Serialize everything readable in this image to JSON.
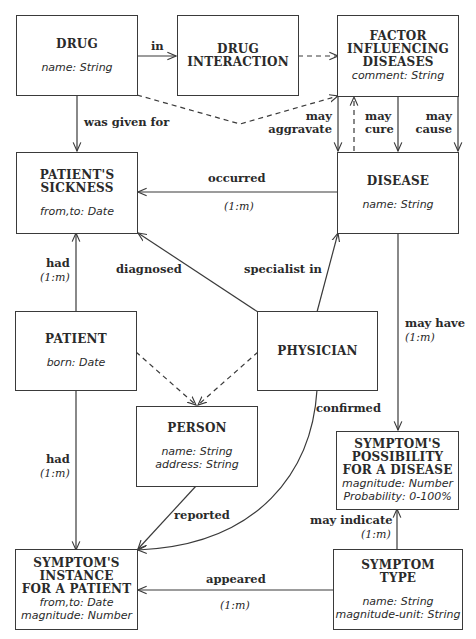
{
  "entities": {
    "drug": {
      "title": "DRUG",
      "attrs": "name: String"
    },
    "drug_interaction": {
      "title": "DRUG\nINTERACTION",
      "attrs": ""
    },
    "factor": {
      "title": "FACTOR\nINFLUENCING\nDISEASES",
      "attrs": "comment: String"
    },
    "patients_sickness": {
      "title": "PATIENT'S\nSICKNESS",
      "attrs": "from,to: Date"
    },
    "disease": {
      "title": "DISEASE",
      "attrs": "name: String"
    },
    "patient": {
      "title": "PATIENT",
      "attrs": "born: Date"
    },
    "physician": {
      "title": "PHYSICIAN",
      "attrs": ""
    },
    "person": {
      "title": "PERSON",
      "attrs": "name: String\naddress: String"
    },
    "symptom_possibility": {
      "title": "SYMPTOM'S\nPOSSIBILITY\nFOR A DISEASE",
      "attrs": "magnitude: Number\nProbability: 0-100%"
    },
    "symptom_instance": {
      "title": "SYMPTOM'S\nINSTANCE\nFOR A PATIENT",
      "attrs": "from,to: Date\nmagnitude: Number"
    },
    "symptom_type": {
      "title": "SYMPTOM\nTYPE",
      "attrs": "name: String\nmagnitude-unit: String"
    }
  },
  "relations": {
    "in": "in",
    "was_given_for": "was given for",
    "may_aggravate": "may\naggravate",
    "may_cure": "may\ncure",
    "may_cause": "may\ncause",
    "occurred": "occurred",
    "occurred_card": "(1:m)",
    "had_sickness": "had",
    "had_sickness_card": "(1:m)",
    "diagnosed": "diagnosed",
    "specialist_in": "specialist in",
    "may_have": "may have",
    "may_have_card": "(1:m)",
    "confirmed": "confirmed",
    "had_symptom": "had",
    "had_symptom_card": "(1:m)",
    "reported": "reported",
    "may_indicate": "may indicate",
    "may_indicate_card": "(1:m)",
    "appeared": "appeared",
    "appeared_card": "(1:m)"
  }
}
